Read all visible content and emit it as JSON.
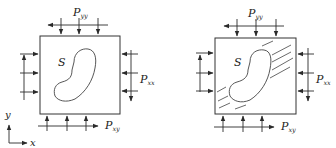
{
  "panels": [
    {
      "id": "intact",
      "region_label": "S",
      "loads": {
        "top": {
          "label": "P",
          "subscript": "yy"
        },
        "right": {
          "label": "P",
          "subscript": "xx"
        },
        "bottom": {
          "label": "P",
          "subscript": "xy"
        }
      },
      "has_cracks": false
    },
    {
      "id": "cracked",
      "region_label": "S",
      "loads": {
        "top": {
          "label": "P",
          "subscript": "yy"
        },
        "right": {
          "label": "P",
          "subscript": "xx"
        },
        "bottom": {
          "label": "P",
          "subscript": "xy"
        }
      },
      "has_cracks": true
    }
  ],
  "axes": {
    "x_label": "x",
    "y_label": "y"
  },
  "colors": {
    "stroke": "#2a2a2a",
    "background": "#ffffff"
  }
}
